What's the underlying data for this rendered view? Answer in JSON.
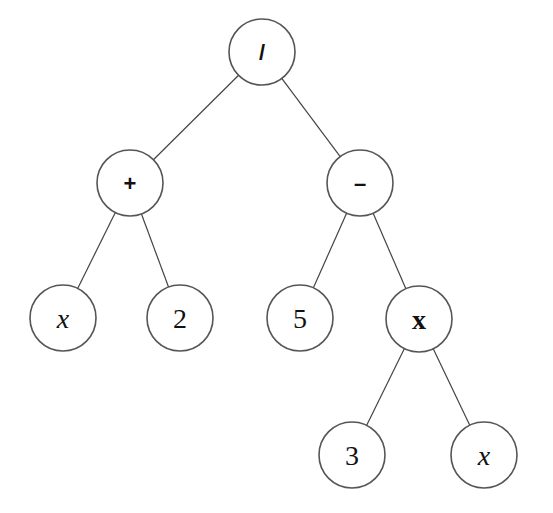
{
  "diagram": {
    "type": "expression-tree",
    "expression": "(x + 2) / (5 - 3x)",
    "nodes": [
      {
        "id": "root",
        "label": "/",
        "kind": "op",
        "cx": 262,
        "cy": 52
      },
      {
        "id": "plus",
        "label": "+",
        "kind": "op",
        "cx": 130,
        "cy": 183
      },
      {
        "id": "minus",
        "label": "–",
        "kind": "op",
        "cx": 360,
        "cy": 183
      },
      {
        "id": "x1",
        "label": "x",
        "kind": "var",
        "cx": 63,
        "cy": 318
      },
      {
        "id": "two",
        "label": "2",
        "kind": "num",
        "cx": 180,
        "cy": 318
      },
      {
        "id": "five",
        "label": "5",
        "kind": "num",
        "cx": 300,
        "cy": 318
      },
      {
        "id": "times",
        "label": "x",
        "kind": "mul",
        "cx": 419,
        "cy": 319
      },
      {
        "id": "three",
        "label": "3",
        "kind": "num",
        "cx": 352,
        "cy": 455
      },
      {
        "id": "x2",
        "label": "x",
        "kind": "var",
        "cx": 484,
        "cy": 455
      }
    ],
    "edges": [
      {
        "from": "root",
        "to": "plus"
      },
      {
        "from": "root",
        "to": "minus"
      },
      {
        "from": "plus",
        "to": "x1"
      },
      {
        "from": "plus",
        "to": "two"
      },
      {
        "from": "minus",
        "to": "five"
      },
      {
        "from": "minus",
        "to": "times"
      },
      {
        "from": "times",
        "to": "three"
      },
      {
        "from": "times",
        "to": "x2"
      }
    ],
    "node_radius": 33
  }
}
